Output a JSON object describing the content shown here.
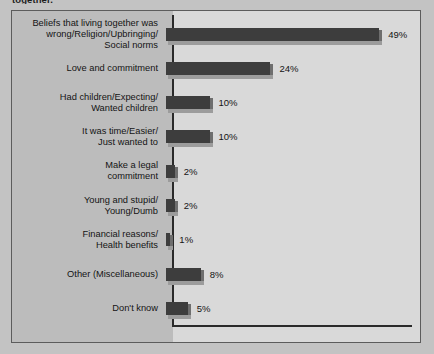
{
  "caption": "together.",
  "chart_data": {
    "type": "bar",
    "orientation": "horizontal",
    "title": "together.",
    "xlabel": "",
    "ylabel": "",
    "xlim": [
      0,
      52
    ],
    "grid": false,
    "legend": null,
    "value_suffix": "%",
    "categories": [
      "Beliefs that living together was\nwrong/Religion/Upbringing/\nSocial norms",
      "Love and commitment",
      "Had children/Expecting/\nWanted children",
      "It was time/Easier/\nJust wanted to",
      "Make a legal\ncommitment",
      "Young and stupid/\nYoung/Dumb",
      "Financial reasons/\nHealth benefits",
      "Other (Miscellaneous)",
      "Don't know"
    ],
    "values": [
      49,
      24,
      10,
      10,
      2,
      2,
      1,
      8,
      5
    ],
    "value_labels": [
      "49%",
      "24%",
      "10%",
      "10%",
      "2%",
      "2%",
      "1%",
      "8%",
      "5%"
    ],
    "colors": {
      "bar_face": "#3d3d3d",
      "bar_bevel": "#9c9c9c",
      "bar_edge": "#6e6e6e",
      "frame_bg": "#bcbcbc",
      "plot_bg": "#d9d9d9",
      "page_bg": "#c3c3c3",
      "axis": "#2a2a2a",
      "text": "#141414"
    }
  }
}
